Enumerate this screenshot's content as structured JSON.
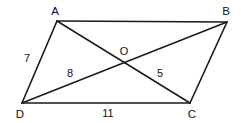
{
  "figure": {
    "type": "parallelogram-with-diagonals",
    "background_color": "#ffffff",
    "stroke_color": "#1a1a1a",
    "text_color": "#111111",
    "width": 241,
    "height": 123
  },
  "vertices": [
    {
      "name": "A",
      "label": "A",
      "x": 57,
      "y": 21,
      "label_x": 55,
      "label_y": 11
    },
    {
      "name": "B",
      "label": "B",
      "x": 227,
      "y": 22,
      "label_x": 226,
      "label_y": 11
    },
    {
      "name": "C",
      "label": "C",
      "x": 190,
      "y": 103,
      "label_x": 192,
      "label_y": 114
    },
    {
      "name": "D",
      "label": "D",
      "x": 22,
      "y": 103,
      "label_x": 20,
      "label_y": 114
    }
  ],
  "intersection": {
    "name": "O",
    "label": "O",
    "x": 124,
    "y": 62,
    "label_x": 124,
    "label_y": 51
  },
  "edges": [
    {
      "name": "AB",
      "from": "A",
      "to": "B"
    },
    {
      "name": "BC",
      "from": "B",
      "to": "C"
    },
    {
      "name": "CD",
      "from": "C",
      "to": "D"
    },
    {
      "name": "DA",
      "from": "D",
      "to": "A"
    }
  ],
  "diagonals": [
    {
      "name": "AC",
      "from": "A",
      "to": "C"
    },
    {
      "name": "BD",
      "from": "B",
      "to": "D"
    }
  ],
  "measurements": [
    {
      "name": "side-DA",
      "value": "7",
      "segment": "DA",
      "label_x": 27,
      "label_y": 58
    },
    {
      "name": "segment-DO",
      "value": "8",
      "segment": "DO",
      "label_x": 70,
      "label_y": 73
    },
    {
      "name": "segment-OC",
      "value": "5",
      "segment": "OC",
      "label_x": 160,
      "label_y": 73
    },
    {
      "name": "side-DC",
      "value": "11",
      "segment": "DC",
      "label_x": 108,
      "label_y": 113
    }
  ]
}
